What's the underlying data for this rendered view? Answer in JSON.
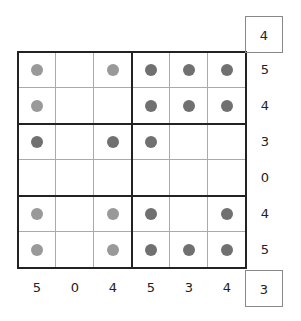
{
  "puzzle": {
    "rows": 6,
    "cols": 6,
    "block_rows": 2,
    "block_cols": 3,
    "colors": {
      "light": "#999999",
      "dark": "#707070"
    },
    "grid": [
      [
        "L",
        "",
        "L",
        "D",
        "D",
        "D"
      ],
      [
        "L",
        "",
        "",
        "D",
        "D",
        "D"
      ],
      [
        "D",
        "",
        "D",
        "D",
        "",
        ""
      ],
      [
        "",
        "",
        "",
        "",
        "",
        ""
      ],
      [
        "L",
        "",
        "L",
        "D",
        "",
        "D"
      ],
      [
        "L",
        "",
        "L",
        "D",
        "D",
        "D"
      ]
    ],
    "row_clues": [
      "5",
      "4",
      "3",
      "0",
      "4",
      "5"
    ],
    "col_clues": [
      "5",
      "0",
      "4",
      "5",
      "3",
      "4"
    ],
    "top_right_box": "4",
    "bottom_right_box": "3"
  }
}
